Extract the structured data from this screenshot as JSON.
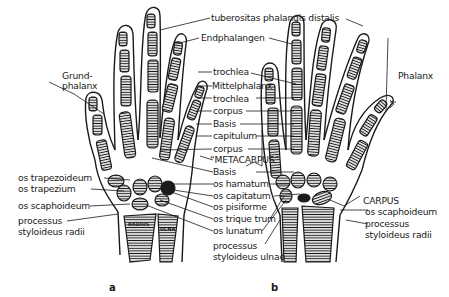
{
  "figure": {
    "panels": [
      {
        "id": "a",
        "label": "a"
      },
      {
        "id": "b",
        "label": "b"
      }
    ],
    "labels_left": {
      "grundphalanx_1": "Grund-",
      "grundphalanx_2": "phalanx",
      "os_trapezoideum": "os trapezoideum",
      "os_trapezium": "os trapezium",
      "os_scaphoideum": "os scaphoideum",
      "processus": "processus",
      "styloideus_radii": "styloideus radii"
    },
    "labels_center": {
      "tuberositas": "tuberositas phalangis distalis",
      "endphalangen": "Endphalangen",
      "trochlea_1": "trochlea",
      "mittelphalanx": "Mittelphalanx",
      "trochlea_2": "trochlea",
      "corpus_1": "corpus",
      "basis_1": "Basis",
      "capitulum": "capitulum",
      "corpus_2": "corpus",
      "metacarpus": "“METACARPUS”",
      "basis_2": "Basis",
      "os_hamatum": "os hamatum",
      "os_capitatum": "os capitatum",
      "os_pisiforme": "os pisiforme",
      "os_triquetrum": "os trique trum",
      "os_lunatum": "os lunatum",
      "processus": "processus",
      "styloideus_ulnae": "styloideus ulnae"
    },
    "labels_right": {
      "phalanx": "Phalanx",
      "carpus": "CARPUS",
      "os_scaphoideum": "os scaphoideum",
      "processus": "processus",
      "styloideus_radii": "styloideus radii"
    },
    "bone_text": {
      "radius": "RADIUS",
      "ulna": "ULNA"
    },
    "colors": {
      "ink": "#1a1a1a",
      "paper": "#ffffff"
    }
  }
}
